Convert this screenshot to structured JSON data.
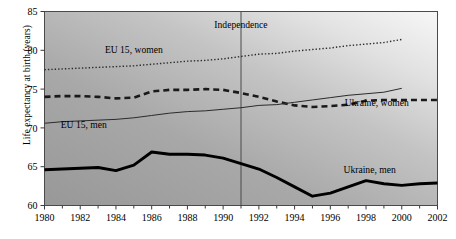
{
  "chart_data": {
    "type": "line",
    "title": "",
    "xlabel": "",
    "ylabel": "Life expectancy at birth (years)",
    "xlim": [
      1980,
      2002
    ],
    "ylim": [
      60,
      85
    ],
    "yticks": [
      60,
      65,
      70,
      75,
      80,
      85
    ],
    "xticks": [
      1980,
      1982,
      1984,
      1986,
      1988,
      1990,
      1992,
      1994,
      1996,
      1998,
      2000,
      2002
    ],
    "xtick_minor_step": 1,
    "grid": false,
    "legend_position": "inline-labels",
    "annotations": [
      {
        "name": "independence-line",
        "label": "Independence",
        "x": 1991,
        "type": "vertical-line"
      }
    ],
    "series": [
      {
        "name": "EU 15, women",
        "style": "dotted",
        "color": "#2b2b2b",
        "label_x": 1985.0,
        "label_y": 79.6,
        "x": [
          1980,
          1981,
          1982,
          1983,
          1984,
          1985,
          1986,
          1987,
          1988,
          1989,
          1990,
          1991,
          1992,
          1993,
          1994,
          1995,
          1996,
          1997,
          1998,
          1999,
          2000
        ],
        "y": [
          77.5,
          77.6,
          77.7,
          77.8,
          77.9,
          78.0,
          78.2,
          78.4,
          78.6,
          78.7,
          78.9,
          79.2,
          79.5,
          79.6,
          79.9,
          80.1,
          80.3,
          80.6,
          80.8,
          81.0,
          81.4
        ]
      },
      {
        "name": "Ukraine, women",
        "style": "dashed",
        "color": "#1a1a1a",
        "label_x": 1998.6,
        "label_y": 72.8,
        "x": [
          1980,
          1981,
          1982,
          1983,
          1984,
          1985,
          1986,
          1987,
          1988,
          1989,
          1990,
          1991,
          1992,
          1993,
          1994,
          1995,
          1996,
          1997,
          1998,
          1999,
          2000,
          2001,
          2002
        ],
        "y": [
          74.0,
          74.1,
          74.1,
          74.0,
          73.8,
          73.9,
          74.7,
          74.9,
          74.9,
          75.0,
          74.9,
          74.5,
          74.0,
          73.4,
          72.9,
          72.7,
          72.8,
          73.0,
          73.5,
          73.6,
          73.6,
          73.6,
          73.6
        ]
      },
      {
        "name": "EU 15, men",
        "style": "solid-thin",
        "color": "#2b2b2b",
        "label_x": 1982.2,
        "label_y": 70.0,
        "x": [
          1980,
          1981,
          1982,
          1983,
          1984,
          1985,
          1986,
          1987,
          1988,
          1989,
          1990,
          1991,
          1992,
          1993,
          1994,
          1995,
          1996,
          1997,
          1998,
          1999,
          2000
        ],
        "y": [
          70.6,
          70.8,
          70.9,
          71.0,
          71.1,
          71.3,
          71.6,
          71.9,
          72.1,
          72.2,
          72.4,
          72.6,
          72.9,
          73.0,
          73.3,
          73.6,
          73.9,
          74.2,
          74.4,
          74.6,
          75.1
        ]
      },
      {
        "name": "Ukraine, men",
        "style": "solid-thick",
        "color": "#000000",
        "label_x": 1998.2,
        "label_y": 64.2,
        "x": [
          1980,
          1981,
          1982,
          1983,
          1984,
          1985,
          1986,
          1987,
          1988,
          1989,
          1990,
          1991,
          1992,
          1993,
          1994,
          1995,
          1996,
          1997,
          1998,
          1999,
          2000,
          2001,
          2002
        ],
        "y": [
          64.6,
          64.7,
          64.8,
          64.9,
          64.5,
          65.2,
          66.9,
          66.6,
          66.6,
          66.5,
          66.1,
          65.4,
          64.7,
          63.6,
          62.4,
          61.2,
          61.6,
          62.4,
          63.2,
          62.8,
          62.6,
          62.8,
          62.9
        ]
      }
    ]
  },
  "axis": {
    "ytick_labels": [
      "60",
      "65",
      "70",
      "75",
      "80",
      "85"
    ],
    "xtick_labels": [
      "1980",
      "1982",
      "1984",
      "1986",
      "1988",
      "1990",
      "1992",
      "1994",
      "1996",
      "1998",
      "2000",
      "2002"
    ],
    "y_axis_title": "Life expectancy at birth (years)"
  },
  "colors": {
    "plot_bg_light": "#f2f2f2",
    "plot_bg_dark": "#9c9c9c",
    "axis": "#3a3a3a",
    "text": "#000000"
  }
}
